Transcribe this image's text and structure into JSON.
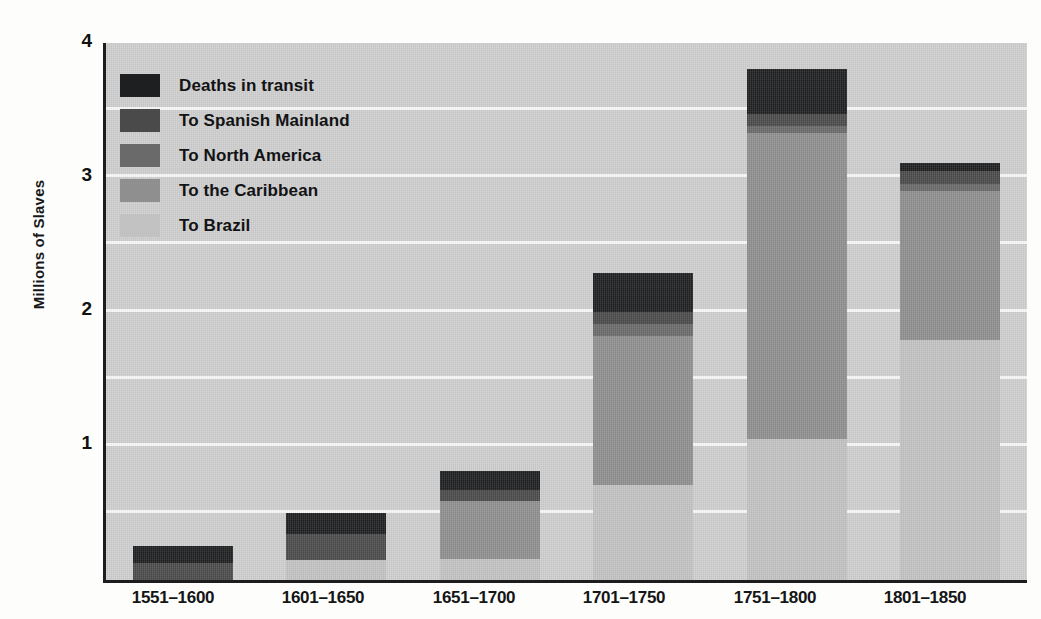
{
  "chart_data": {
    "type": "bar",
    "stacked": true,
    "title": "",
    "xlabel": "",
    "ylabel": "Millions of Slaves",
    "ylim": [
      0,
      4
    ],
    "yticks": [
      1,
      2,
      3,
      4
    ],
    "ytick_labels": [
      "1",
      "2",
      "3",
      "4"
    ],
    "gridlines": [
      0.5,
      1.0,
      1.5,
      2.0,
      2.5,
      3.0,
      3.5
    ],
    "grid": true,
    "legend_position": "upper left",
    "categories": [
      "1551–1600",
      "1601–1650",
      "1651–1700",
      "1701–1750",
      "1751–1800",
      "1801–1850"
    ],
    "series": [
      {
        "name": "To Brazil",
        "color": "#c2c2c2",
        "values": [
          0.0,
          0.15,
          0.16,
          0.71,
          1.05,
          1.79
        ]
      },
      {
        "name": "To the Caribbean",
        "color": "#8f8f8f",
        "values": [
          0.0,
          0.0,
          0.43,
          1.11,
          2.28,
          1.11
        ]
      },
      {
        "name": "To North America",
        "color": "#6a6a6a",
        "values": [
          0.0,
          0.0,
          0.0,
          0.09,
          0.05,
          0.05
        ]
      },
      {
        "name": "To Spanish Mainland",
        "color": "#4a4a4a",
        "values": [
          0.13,
          0.19,
          0.08,
          0.09,
          0.09,
          0.1
        ]
      },
      {
        "name": "Deaths in transit",
        "color": "#1e1f21",
        "values": [
          0.12,
          0.16,
          0.14,
          0.29,
          0.34,
          0.06
        ]
      }
    ],
    "totals": [
      0.25,
      0.5,
      0.81,
      2.29,
      3.81,
      3.11
    ],
    "stack_order_bottom_to_top": [
      "To Brazil",
      "To the Caribbean",
      "To North America",
      "To Spanish Mainland",
      "Deaths in transit"
    ]
  },
  "axis": {
    "y_title": "Millions of Slaves",
    "y_tick_4": "4",
    "y_tick_3": "3",
    "y_tick_2": "2",
    "y_tick_1": "1",
    "x_labels": [
      "1551–1600",
      "1601–1650",
      "1651–1700",
      "1701–1750",
      "1751–1800",
      "1801–1850"
    ]
  },
  "legend": {
    "items": [
      {
        "label": "Deaths in transit",
        "color": "#1e1f21"
      },
      {
        "label": "To Spanish Mainland",
        "color": "#4a4a4a"
      },
      {
        "label": "To North America",
        "color": "#6a6a6a"
      },
      {
        "label": "To the Caribbean",
        "color": "#8f8f8f"
      },
      {
        "label": "To Brazil",
        "color": "#c2c2c2"
      }
    ]
  },
  "colors": {
    "plot_background": "#cfcfcf",
    "page_background": "#fdfdfb",
    "axis": "#1b1d1f",
    "gridline": "#fafafa",
    "text": "#121314"
  }
}
